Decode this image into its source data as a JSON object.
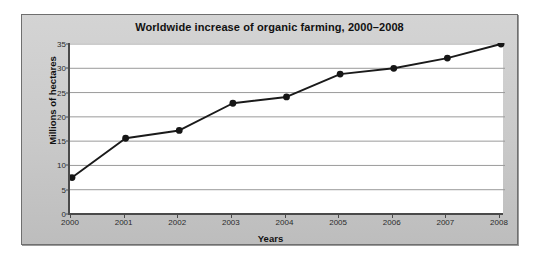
{
  "chart_data": {
    "type": "line",
    "title": "Worldwide increase of organic farming, 2000–2008",
    "xlabel": "Years",
    "ylabel": "Millions of hectares",
    "categories": [
      "2000",
      "2001",
      "2002",
      "2003",
      "2004",
      "2005",
      "2006",
      "2007",
      "2008"
    ],
    "x": [
      2000,
      2001,
      2002,
      2003,
      2004,
      2005,
      2006,
      2007,
      2008
    ],
    "values": [
      7.5,
      15.6,
      17.2,
      22.8,
      24.1,
      28.8,
      30.0,
      32.1,
      35.0
    ],
    "series": [
      {
        "name": "Organic farmland",
        "values": [
          7.5,
          15.6,
          17.2,
          22.8,
          24.1,
          28.8,
          30.0,
          32.1,
          35.0
        ]
      }
    ],
    "ylim": [
      0,
      35
    ],
    "yticks": [
      0,
      5,
      10,
      15,
      20,
      25,
      30,
      35
    ],
    "ytick_labels": [
      "0",
      "5",
      "10",
      "15",
      "20",
      "25",
      "30",
      "35"
    ],
    "xlim": [
      2000,
      2008
    ],
    "xticks": [
      2000,
      2001,
      2002,
      2003,
      2004,
      2005,
      2006,
      2007,
      2008
    ],
    "xtick_labels": [
      "2000",
      "2001",
      "2002",
      "2003",
      "2004",
      "2005",
      "2006",
      "2007",
      "2008"
    ],
    "grid": "horizontal",
    "legend": "none",
    "marker": "filled-circle",
    "colors": {
      "line": "#1a1a1a",
      "marker": "#161616",
      "grid": "#9a9a9a",
      "axis": "#4a4a4a",
      "plot_background": "#ffffff",
      "panel_background": "#c9c9c9",
      "panel_border": "#6f6f6f",
      "text": "#111111"
    }
  }
}
